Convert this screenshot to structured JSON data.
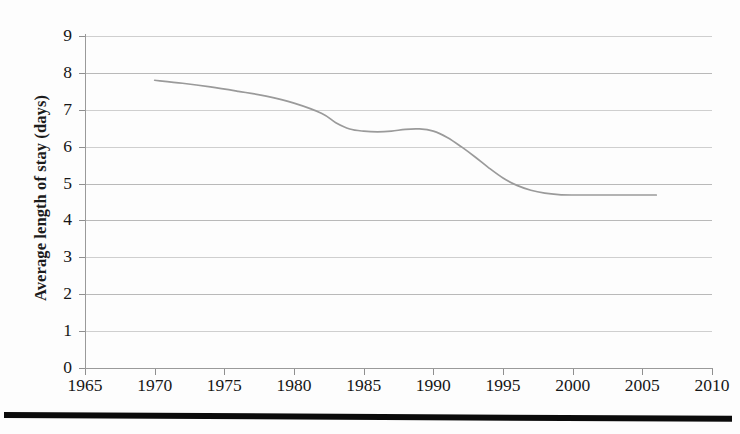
{
  "chart_data": {
    "type": "line",
    "title": "",
    "xlabel": "",
    "ylabel": "Average length of stay (days)",
    "xlim": [
      1965,
      2010
    ],
    "ylim": [
      0,
      9
    ],
    "grid": true,
    "legend": "none",
    "x_ticks": [
      "1965",
      "1970",
      "1975",
      "1980",
      "1985",
      "1990",
      "1995",
      "2000",
      "2005",
      "2010"
    ],
    "y_ticks": [
      "0",
      "1",
      "2",
      "3",
      "4",
      "5",
      "6",
      "7",
      "8",
      "9"
    ],
    "series": [
      {
        "name": "Average length of stay",
        "color": "#9a9a9a",
        "x": [
          1970,
          1972,
          1974,
          1976,
          1978,
          1980,
          1982,
          1983,
          1984,
          1985,
          1986,
          1987,
          1988,
          1989,
          1990,
          1991,
          1992,
          1993,
          1994,
          1995,
          1996,
          1997,
          1998,
          1999,
          2000,
          2002,
          2004,
          2006
        ],
        "values": [
          7.8,
          7.72,
          7.62,
          7.5,
          7.37,
          7.18,
          6.9,
          6.65,
          6.48,
          6.42,
          6.4,
          6.42,
          6.47,
          6.48,
          6.42,
          6.25,
          6.0,
          5.72,
          5.42,
          5.15,
          4.95,
          4.82,
          4.74,
          4.7,
          4.69,
          4.69,
          4.69,
          4.69
        ]
      }
    ]
  },
  "axes": {
    "y_title": "Average length of stay (days)"
  }
}
